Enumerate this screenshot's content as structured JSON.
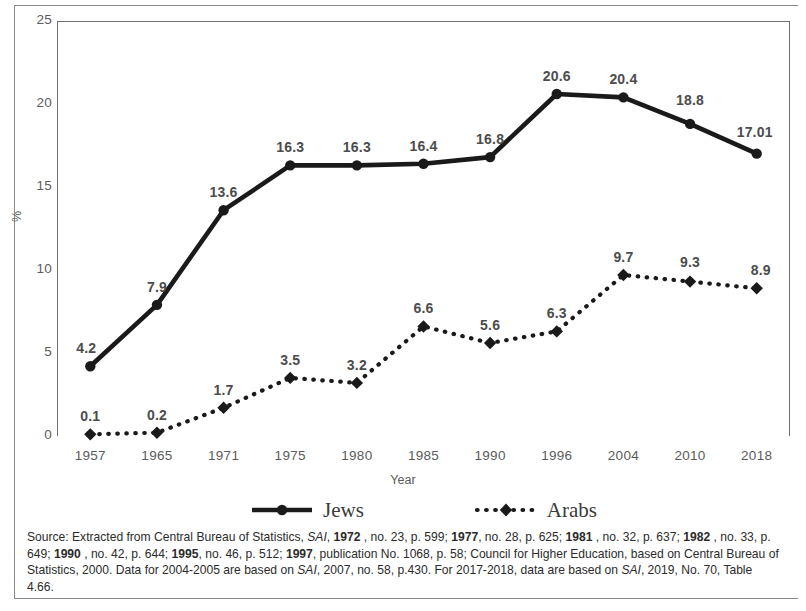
{
  "chart_data": {
    "type": "line",
    "title": "",
    "xlabel": "Year",
    "ylabel": "%",
    "ylim": [
      0,
      25
    ],
    "yticks": [
      0,
      5,
      10,
      15,
      20,
      25
    ],
    "grid": false,
    "legend_position": "bottom",
    "categories": [
      "1957",
      "1965",
      "1971",
      "1975",
      "1980",
      "1985",
      "1990",
      "1996",
      "2004",
      "2010",
      "2018"
    ],
    "series": [
      {
        "name": "Jews",
        "style": "solid",
        "marker": "filled-circle",
        "color": "#1a1a1a",
        "values": [
          4.2,
          7.9,
          13.6,
          16.3,
          16.3,
          16.4,
          16.8,
          20.6,
          20.4,
          18.8,
          17.01
        ],
        "labels": [
          "4.2",
          "7.9",
          "13.6",
          "16.3",
          "16.3",
          "16.4",
          "16.8",
          "20.6",
          "20.4",
          "18.8",
          "17.01"
        ]
      },
      {
        "name": "Arabs",
        "style": "dotted",
        "marker": "filled-diamond",
        "color": "#1a1a1a",
        "values": [
          0.1,
          0.2,
          1.7,
          3.5,
          3.2,
          6.6,
          5.6,
          6.3,
          9.7,
          9.3,
          8.9
        ],
        "labels": [
          "0.1",
          "0.2",
          "1.7",
          "3.5",
          "3.2",
          "6.6",
          "5.6",
          "6.3",
          "9.7",
          "9.3",
          "8.9"
        ]
      }
    ]
  },
  "legend": {
    "items": [
      {
        "label": "Jews"
      },
      {
        "label": "Arabs"
      }
    ]
  },
  "source_note": {
    "line1_a": "Source: Extracted from Central Bureau of Statistics, ",
    "line1_italic": "SAI",
    "line1_b": ", ",
    "line1_bold1": "1972",
    "line1_c": " , no. 23, p. 599; ",
    "line1_bold2": "1977",
    "line1_d": ", no. 28, p. 625; ",
    "line1_bold3": "1981",
    "line1_e": " , no. 32, p. 637; ",
    "line1_bold4": "1982",
    "line1_f": " , no. 33,",
    "line2_a": "p. 649; ",
    "line2_bold1": "1990",
    "line2_b": " , no. 42, p. 644; ",
    "line2_bold2": "1995",
    "line2_c": ", no. 46, p. 512; ",
    "line2_bold3": "1997",
    "line2_d": ", publication No. 1068, p. 58; Council for Higher Education, based on Central",
    "line3_a": "Bureau of Statistics, 2000. Data for 2004-2005 are based on ",
    "line3_italic": "SAI",
    "line3_b": ", 2007, no. 58, p.430. For 2017-2018, data are based on ",
    "line3_italic2": "SAI",
    "line3_c": ", 2019, No.",
    "line4": "70, Table 4.66."
  }
}
